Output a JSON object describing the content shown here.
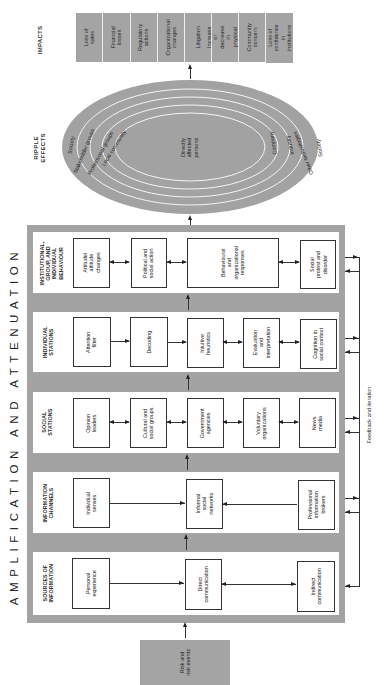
{
  "impacts": {
    "heading": "IMPACTS",
    "items": [
      "Loss of\nsales",
      "Financial\nlosses",
      "Regulatory\nactions",
      "Organizational\nchanges",
      "Litigation",
      "Increase or\ndecrease in\nphysical risk",
      "Community\nconcern",
      "Loss of\nconfidence in\ninstitutions"
    ]
  },
  "ripple": {
    "heading": "RIPPLE\nEFFECTS",
    "center": "Directly\naffected\npersons",
    "rings_left": [
      "Society",
      "Stakeholder groups",
      "Professional groups",
      "Local community"
    ],
    "rings_right": [
      "Company",
      "Industry",
      "Other technologies",
      "Society"
    ]
  },
  "title": "AMPLIFICATION AND ATTENUATION",
  "stages": [
    {
      "label": "INSTITUTIONAL,\nGROUP, AND\nINDIVIDUAL\nBEHAVIOUR",
      "boxes": [
        "Attitude/\nattitude\nchanges",
        "Political and\nsocial action",
        "Behavioural\nand\norganizational\nresponses",
        "Social\nprotest and\ndisorder"
      ]
    },
    {
      "label": "INDIVIDUAL\nSTATIONS",
      "boxes": [
        "Attention\nfilter",
        "Decoding",
        "Intuitive\nheuristics",
        "Evaluation\nand\ninterpretation",
        "Cognition in\nsocial context"
      ]
    },
    {
      "label": "SOCIAL\nSTATIONS",
      "boxes": [
        "Opinion\nleaders",
        "Cultural and\nsocial groups",
        "Government\nagencies",
        "Voluntary\norganizations",
        "News\nmedia"
      ]
    },
    {
      "label": "INFORMATION\nCHANNELS",
      "boxes": [
        "Individual\nsenses",
        "Informal\nsocial networks",
        "Professional\ninformation\nbrokers"
      ]
    },
    {
      "label": "SOURCES OF\nINFORMATION",
      "boxes": [
        "Personal\nexperience",
        "Direct\ncommunication",
        "Indirect\ncommunication"
      ]
    }
  ],
  "feedback": "Feedback and iteration",
  "input": "Risk and\nrisk events",
  "colors": {
    "grey_fill": "#a9a9a9",
    "line": "#333333",
    "panel": "#ffffff"
  }
}
